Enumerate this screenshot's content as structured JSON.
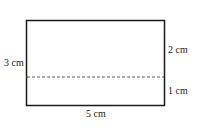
{
  "diagram": {
    "shape": "rectangle divided by dashed line",
    "labels": {
      "left": "3 cm",
      "right_top": "2 cm",
      "right_bottom": "1 cm",
      "bottom": "5 cm"
    },
    "colors": {
      "stroke": "#1a1a1a",
      "dashed": "#333333",
      "background": "#ffffff"
    }
  }
}
